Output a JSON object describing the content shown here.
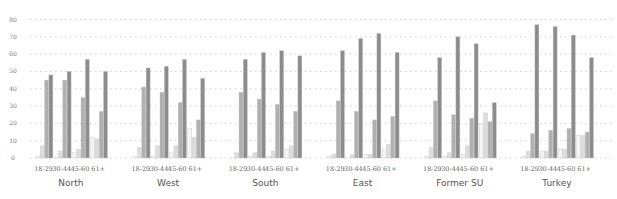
{
  "chart_data": {
    "type": "bar",
    "title": "",
    "xlabel": "",
    "ylabel": "",
    "ylim": [
      0,
      80
    ],
    "yticks": [
      0,
      10,
      20,
      30,
      40,
      50,
      60,
      70,
      80
    ],
    "grid": true,
    "legend": null,
    "series_colors": [
      "#f4f4f4",
      "#dcdcdc",
      "#b0b0b0",
      "#8c8c8c"
    ],
    "series": [
      {
        "name": "Series 1"
      },
      {
        "name": "Series 2"
      },
      {
        "name": "Series 3"
      },
      {
        "name": "Series 4"
      }
    ],
    "age_groups": [
      "18-29",
      "30-44",
      "45-60",
      "61+"
    ],
    "regions": [
      {
        "name": "North",
        "values": [
          [
            1,
            7,
            45,
            48
          ],
          [
            0,
            4,
            45,
            50
          ],
          [
            3,
            5,
            35,
            57
          ],
          [
            12,
            11,
            27,
            50
          ]
        ]
      },
      {
        "name": "West",
        "values": [
          [
            1,
            6,
            41,
            52
          ],
          [
            1,
            7,
            38,
            53
          ],
          [
            3,
            7,
            32,
            57
          ],
          [
            17,
            12,
            22,
            46
          ]
        ]
      },
      {
        "name": "South",
        "values": [
          [
            0,
            3,
            38,
            57
          ],
          [
            1,
            3,
            34,
            61
          ],
          [
            1,
            4,
            31,
            62
          ],
          [
            5,
            7,
            27,
            59
          ]
        ]
      },
      {
        "name": "East",
        "values": [
          [
            1,
            2,
            33,
            62
          ],
          [
            0,
            2,
            27,
            69
          ],
          [
            2,
            2,
            22,
            72
          ],
          [
            5,
            8,
            24,
            61
          ]
        ]
      },
      {
        "name": "Former SU",
        "values": [
          [
            1,
            6,
            33,
            58
          ],
          [
            1,
            3,
            25,
            70
          ],
          [
            2,
            7,
            23,
            66
          ],
          [
            20,
            26,
            21,
            32
          ]
        ]
      },
      {
        "name": "Turkey",
        "values": [
          [
            1,
            4,
            14,
            77
          ],
          [
            4,
            4,
            16,
            76
          ],
          [
            5,
            5,
            17,
            71
          ],
          [
            13,
            13,
            15,
            58
          ]
        ]
      }
    ]
  }
}
